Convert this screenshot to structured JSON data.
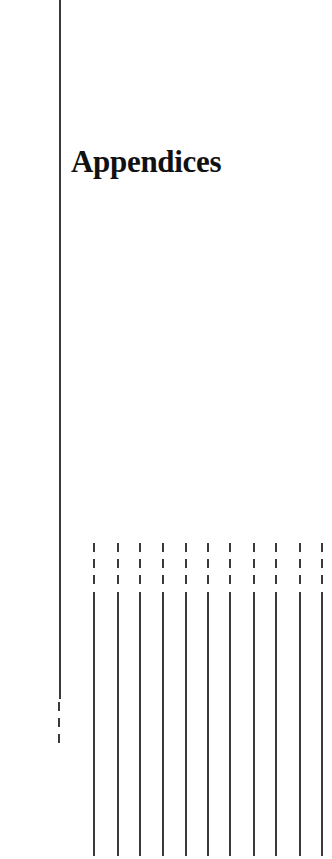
{
  "page": {
    "title": "Appendices"
  },
  "decor": {
    "left_rule": {
      "x": 59,
      "solid_top": 0,
      "solid_bottom": 699,
      "dash_top": 702,
      "dash_bottom": 750
    },
    "bottom_rules": {
      "x_positions": [
        93,
        117,
        139,
        162,
        185,
        207,
        229,
        253,
        275,
        299,
        321
      ],
      "dash_top": 543,
      "dash_bottom": 590,
      "solid_top": 592,
      "solid_bottom": 856
    },
    "line_color": "#3a3a3a"
  }
}
